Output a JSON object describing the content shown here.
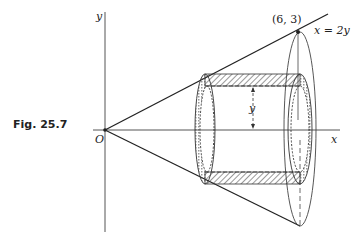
{
  "figure": {
    "caption": "Fig. 25.7",
    "axes": {
      "y_label": "y",
      "x_label": "x",
      "origin_label": "O"
    },
    "point_label": "(6, 3)",
    "line_label": "x = 2y",
    "radius_label": "y"
  },
  "colors": {
    "ink": "#222222",
    "axis": "#555555",
    "background": "#ffffff"
  }
}
